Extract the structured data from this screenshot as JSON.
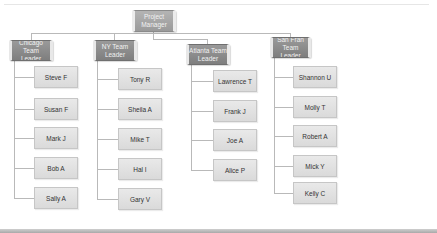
{
  "colors": {
    "header_fill": "#8a8a8a",
    "manager_fill": "#a6a6a6",
    "child_fill": "#e1e1e1",
    "connector": "#b9b9b9",
    "child_text": "#333333",
    "header_text": "#f2f2f2"
  },
  "manager": {
    "label": "Project\nManager"
  },
  "teams": [
    {
      "leader": "Chicago Team\nLeader",
      "members": [
        "Steve F",
        "Susan F",
        "Mark J",
        "Bob A",
        "Sally A"
      ]
    },
    {
      "leader": "NY Team\nLeader",
      "members": [
        "Tony R",
        "Sheila A",
        "Mike T",
        "Hal I",
        "Gary V"
      ]
    },
    {
      "leader": "Atlanta Team\nLeader",
      "members": [
        "Lawrence T",
        "Frank J",
        "Joe A",
        "Alice P"
      ]
    },
    {
      "leader": "San Fran\nTeam Leader",
      "members": [
        "Shannon U",
        "Molly T",
        "Robert A",
        "Mick Y",
        "Kelly C"
      ]
    }
  ]
}
